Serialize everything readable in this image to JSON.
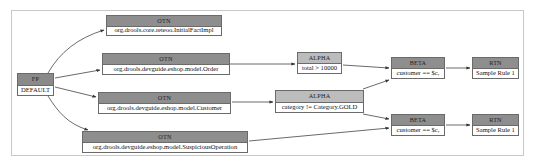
{
  "diagram": {
    "colors": {
      "frame_border": "#c8c8c8",
      "node_border": "#6a6a6a",
      "otn_header": "#8e8e8e",
      "alpha_header": "#bcbcbc",
      "beta_header": "#8e8e8e",
      "rtn_header": "#8e8e8e",
      "edge": "#444444"
    },
    "nodes": {
      "fp": {
        "type": "FP",
        "label": "DEFAULT"
      },
      "otn_initial": {
        "type": "OTN",
        "label": "org.drools.core.reteoo.InitialFactImpl"
      },
      "otn_order": {
        "type": "OTN",
        "label": "org.drools.devguide.eshop.model.Order"
      },
      "otn_customer": {
        "type": "OTN",
        "label": "org.drools.devguide.eshop.model.Customer"
      },
      "otn_suspicious": {
        "type": "OTN",
        "label": "org.drools.devguide.eshop.model.SuspiciousOperation"
      },
      "alpha_total": {
        "type": "ALPHA",
        "label": "total > 10000"
      },
      "alpha_category": {
        "type": "ALPHA",
        "label": "category != Category.GOLD"
      },
      "beta_1": {
        "type": "BETA",
        "label": "customer == $c,"
      },
      "beta_2": {
        "type": "BETA",
        "label": "customer == $c,"
      },
      "rtn_1": {
        "type": "RTN",
        "label": "Sample Rule 1"
      },
      "rtn_2": {
        "type": "RTN",
        "label": "Sample Rule 1"
      }
    },
    "edges": [
      {
        "from": "fp",
        "to": "otn_initial"
      },
      {
        "from": "fp",
        "to": "otn_order"
      },
      {
        "from": "fp",
        "to": "otn_customer"
      },
      {
        "from": "fp",
        "to": "otn_suspicious"
      },
      {
        "from": "otn_order",
        "to": "alpha_total"
      },
      {
        "from": "otn_customer",
        "to": "alpha_category"
      },
      {
        "from": "alpha_total",
        "to": "beta_1"
      },
      {
        "from": "alpha_category",
        "to": "beta_1"
      },
      {
        "from": "alpha_category",
        "to": "beta_2"
      },
      {
        "from": "otn_suspicious",
        "to": "beta_2"
      },
      {
        "from": "beta_1",
        "to": "rtn_1"
      },
      {
        "from": "beta_2",
        "to": "rtn_2"
      }
    ]
  }
}
